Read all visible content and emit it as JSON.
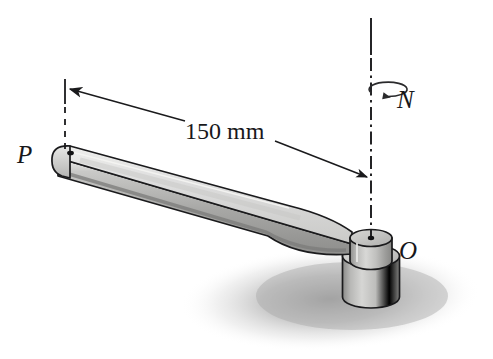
{
  "figure": {
    "background_color": "#ffffff",
    "width": 493,
    "height": 359,
    "line_color": "#1a1a1c"
  },
  "labels": {
    "point_p": "P",
    "point_o": "O",
    "rotation_rate": "N",
    "dimension": "150 mm"
  },
  "annotations": {
    "dimension_value": "150",
    "dimension_units": "mm",
    "axis_style": "dash-dot vertical axis of rotation",
    "rotation_indicator": "curved arrow about vertical axis labeled N"
  },
  "geometry": {
    "arm_end_p_x": 62,
    "arm_end_p_y": 152,
    "hub_center_x": 371,
    "hub_center_y": 238,
    "axis_top_y": 18,
    "axis_bottom_y": 240,
    "arm_length_mm": 150
  },
  "colors": {
    "arm_top_face": "#d8d8d6",
    "arm_side_face": "#a9a9a7",
    "arm_bottom_edge": "#8a8a88",
    "hub_light": "#d2d2d0",
    "hub_mid": "#a5a5a3",
    "hub_dark": "#7d7d7b",
    "shadow": "#bdbdbd",
    "outline": "#1a1a1c"
  }
}
